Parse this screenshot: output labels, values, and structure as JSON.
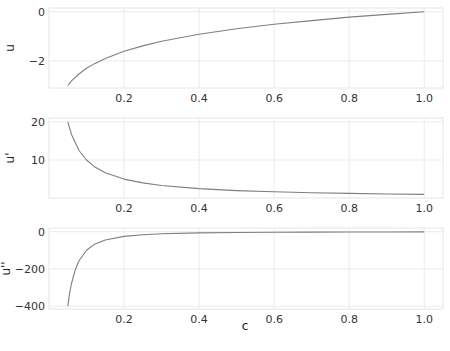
{
  "figure": {
    "xlabel": "c",
    "caption": "",
    "line_color": "#7f7f7f",
    "grid_color": "#ebebeb",
    "spine_color": "#e6e6e6"
  },
  "chart_data": [
    {
      "type": "line",
      "title": "",
      "xlabel": "",
      "ylabel": "u",
      "x_ticks": [
        "0.2",
        "0.4",
        "0.6",
        "0.8",
        "1.0"
      ],
      "y_ticks": [
        "0",
        "−2"
      ],
      "xlim": [
        0.0,
        1.05
      ],
      "ylim": [
        -3.1,
        0.15
      ],
      "grid": true,
      "series": [
        {
          "name": "u(c) = ln(c)",
          "x": [
            0.05,
            0.06,
            0.08,
            0.1,
            0.12,
            0.15,
            0.2,
            0.25,
            0.3,
            0.4,
            0.5,
            0.6,
            0.7,
            0.8,
            0.9,
            1.0
          ],
          "y": [
            -3.0,
            -2.81,
            -2.53,
            -2.3,
            -2.12,
            -1.9,
            -1.61,
            -1.39,
            -1.2,
            -0.92,
            -0.69,
            -0.51,
            -0.36,
            -0.22,
            -0.11,
            0.0
          ]
        }
      ]
    },
    {
      "type": "line",
      "title": "",
      "xlabel": "",
      "ylabel": "u'",
      "x_ticks": [
        "0.2",
        "0.4",
        "0.6",
        "0.8",
        "1.0"
      ],
      "y_ticks": [
        "20",
        "10"
      ],
      "xlim": [
        0.0,
        1.05
      ],
      "ylim": [
        0.05,
        21.0
      ],
      "grid": true,
      "series": [
        {
          "name": "u'(c) = 1/c",
          "x": [
            0.05,
            0.06,
            0.08,
            0.1,
            0.12,
            0.15,
            0.2,
            0.25,
            0.3,
            0.4,
            0.5,
            0.6,
            0.7,
            0.8,
            0.9,
            1.0
          ],
          "y": [
            20.0,
            16.67,
            12.5,
            10.0,
            8.33,
            6.67,
            5.0,
            4.0,
            3.33,
            2.5,
            2.0,
            1.67,
            1.43,
            1.25,
            1.11,
            1.0
          ]
        }
      ]
    },
    {
      "type": "line",
      "title": "",
      "xlabel": "c",
      "ylabel": "u''",
      "x_ticks": [
        "0.2",
        "0.4",
        "0.6",
        "0.8",
        "1.0"
      ],
      "y_ticks": [
        "0",
        "−200",
        "−400"
      ],
      "xlim": [
        0.0,
        1.05
      ],
      "ylim": [
        -415,
        20
      ],
      "grid": true,
      "series": [
        {
          "name": "u''(c) = -1/c^2",
          "x": [
            0.05,
            0.055,
            0.06,
            0.07,
            0.08,
            0.1,
            0.12,
            0.15,
            0.2,
            0.25,
            0.3,
            0.4,
            0.5,
            0.6,
            0.7,
            0.8,
            0.9,
            1.0
          ],
          "y": [
            -400.0,
            -330.6,
            -277.8,
            -204.1,
            -156.3,
            -100.0,
            -69.4,
            -44.4,
            -25.0,
            -16.0,
            -11.1,
            -6.25,
            -4.0,
            -2.78,
            -2.04,
            -1.56,
            -1.23,
            -1.0
          ]
        }
      ]
    }
  ]
}
